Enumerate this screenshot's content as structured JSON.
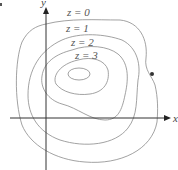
{
  "diagram": {
    "title": "",
    "axes": {
      "x_label": "x",
      "y_label": "y"
    },
    "contours": [
      {
        "level": 0,
        "label": "z = 0"
      },
      {
        "level": 1,
        "label": "z = 1"
      },
      {
        "level": 2,
        "label": "z = 2"
      },
      {
        "level": 3,
        "label": "z = 3"
      }
    ],
    "marked_point": {
      "on_contour": "z = 0"
    },
    "colors": {
      "contour": "#8a8a8a",
      "axis": "#333333",
      "point": "#333333"
    }
  }
}
